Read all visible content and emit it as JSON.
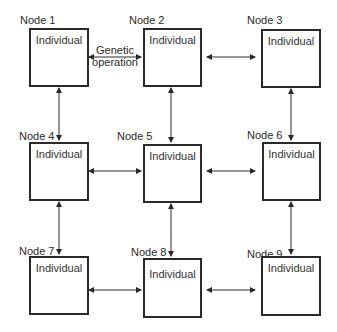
{
  "diagram": {
    "nodes": [
      {
        "label": "Node 1",
        "content": "Individual"
      },
      {
        "label": "Node 2",
        "content": "Individual"
      },
      {
        "label": "Node 3",
        "content": "Individual"
      },
      {
        "label": "Node 4",
        "content": "Individual"
      },
      {
        "label": "Node 5",
        "content": "Individual"
      },
      {
        "label": "Node 6",
        "content": "Individual"
      },
      {
        "label": "Node 7",
        "content": "Individual"
      },
      {
        "label": "Node 8",
        "content": "Individual"
      },
      {
        "label": "Node 9",
        "content": "Individual"
      }
    ],
    "edge_label": {
      "line1": "Genetic",
      "line2": "operation"
    },
    "edges": [
      [
        "Node 1",
        "Node 2"
      ],
      [
        "Node 2",
        "Node 3"
      ],
      [
        "Node 4",
        "Node 5"
      ],
      [
        "Node 5",
        "Node 6"
      ],
      [
        "Node 7",
        "Node 8"
      ],
      [
        "Node 8",
        "Node 9"
      ],
      [
        "Node 1",
        "Node 4"
      ],
      [
        "Node 4",
        "Node 7"
      ],
      [
        "Node 2",
        "Node 5"
      ],
      [
        "Node 5",
        "Node 8"
      ],
      [
        "Node 3",
        "Node 6"
      ],
      [
        "Node 6",
        "Node 9"
      ]
    ],
    "colors": {
      "stroke": "#2a2a2a",
      "background": "#ffffff"
    }
  }
}
